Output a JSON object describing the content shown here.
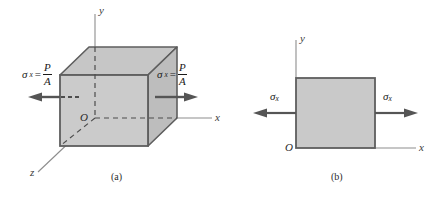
{
  "figure": {
    "panels": [
      {
        "id": "a",
        "caption": "(a)",
        "type": "cube-element",
        "origin_label": "O",
        "axes": [
          {
            "name": "y-axis",
            "label": "y"
          },
          {
            "name": "x-axis",
            "label": "x"
          },
          {
            "name": "z-axis",
            "label": "z"
          }
        ],
        "stress_left": {
          "symbol": "σ",
          "subscript": "x",
          "equals": "=",
          "numerator": "P",
          "denominator": "A"
        },
        "stress_right": {
          "symbol": "σ",
          "subscript": "x",
          "equals": "=",
          "numerator": "P",
          "denominator": "A"
        }
      },
      {
        "id": "b",
        "caption": "(b)",
        "type": "plane-element",
        "origin_label": "O",
        "axes": [
          {
            "name": "y-axis",
            "label": "y"
          },
          {
            "name": "x-axis",
            "label": "x"
          }
        ],
        "stress_left": {
          "symbol": "σ",
          "subscript": "x"
        },
        "stress_right": {
          "symbol": "σ",
          "subscript": "x"
        }
      }
    ],
    "colors": {
      "face_fill": "#c9c9c9",
      "top_fill": "#c4c4c4",
      "side_fill": "#bdbdbd",
      "edge_stroke": "#595959",
      "arrow": "#555555",
      "axis": "#8d8d8d",
      "dashed": "#4d4d4d",
      "text": "#1a1a1a",
      "background": "#ffffff"
    }
  }
}
